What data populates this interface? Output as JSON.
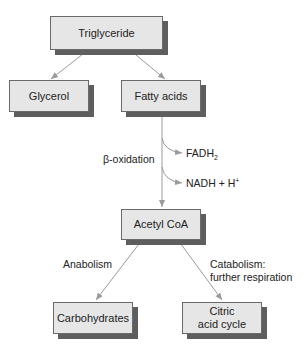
{
  "diagram": {
    "nodes": {
      "triglyceride": "Triglyceride",
      "glycerol": "Glycerol",
      "fatty_acids": "Fatty acids",
      "acetyl_coa": "Acetyl CoA",
      "carbohydrates": "Carbohydrates",
      "citric_line1": "Citric",
      "citric_line2": "acid cycle"
    },
    "labels": {
      "beta_oxidation": "β-oxidation",
      "fadh_base": "FADH",
      "fadh_sub": "2",
      "nadh_base": "NADH + H",
      "nadh_sup": "+",
      "anabolism": "Anabolism",
      "catabolism_line1": "Catabolism:",
      "catabolism_line2": "further respiration"
    },
    "edges": [
      {
        "from": "Triglyceride",
        "to": "Glycerol"
      },
      {
        "from": "Triglyceride",
        "to": "Fatty acids"
      },
      {
        "from": "Fatty acids",
        "to": "Acetyl CoA",
        "label": "β-oxidation",
        "byproducts": [
          "FADH2",
          "NADH + H+"
        ]
      },
      {
        "from": "Acetyl CoA",
        "to": "Carbohydrates",
        "label": "Anabolism"
      },
      {
        "from": "Acetyl CoA",
        "to": "Citric acid cycle",
        "label": "Catabolism: further respiration"
      }
    ],
    "colors": {
      "box_fill": "#e6e6e6",
      "box_border": "#6a6a6a",
      "shadow": "#5e5e5e",
      "arrow": "#9a9a9a"
    }
  }
}
